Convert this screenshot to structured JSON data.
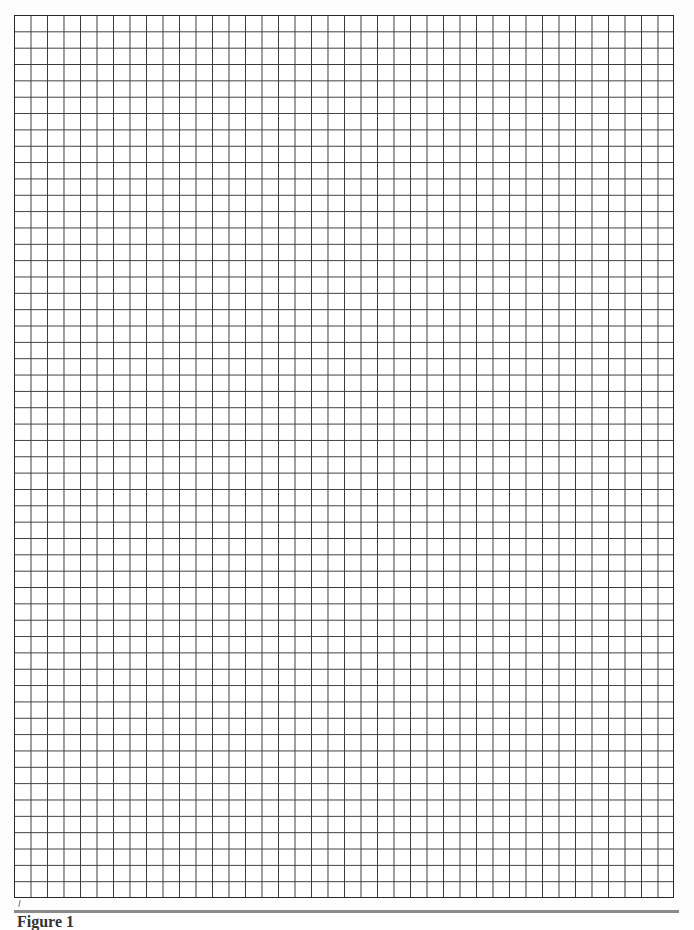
{
  "document": {
    "type": "graph-paper",
    "grid": {
      "columns": 40,
      "rows": 54,
      "line_color": "#3a3a3a",
      "background_color": "#ffffff"
    },
    "rule_color": "#8a8a8a",
    "caption_text": "Figure 1"
  }
}
